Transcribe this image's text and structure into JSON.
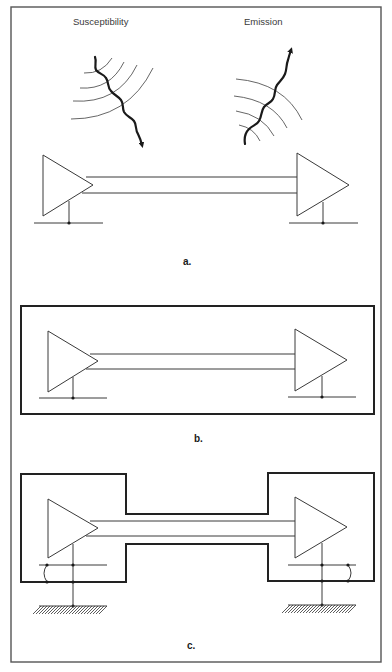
{
  "figure": {
    "labels": {
      "susceptibility": "Susceptibility",
      "emission": "Emission"
    },
    "panels": [
      {
        "id": "a",
        "caption": "a.",
        "description": "Unshielded driver-receiver link showing susceptibility (incoming radiated interference) and emission (outgoing radiation)"
      },
      {
        "id": "b",
        "caption": "b.",
        "description": "Driver, cable and receiver enclosed in a single continuous shield"
      },
      {
        "id": "c",
        "caption": "c.",
        "description": "Separate shielded enclosures joined by a shielded cable, each bonded to earth ground with signal-ground jumper"
      }
    ],
    "colors": {
      "line": "#3a3a3a",
      "shield": "#222222",
      "frame": "#555555",
      "background": "#ffffff"
    }
  }
}
